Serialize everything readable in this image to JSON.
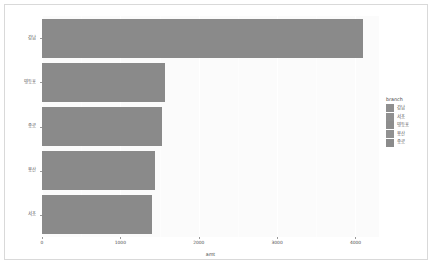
{
  "chart_data": {
    "type": "bar",
    "orientation": "horizontal",
    "title": "",
    "xlabel": "amt",
    "ylabel": "reorder(branch, -amt)",
    "categories": [
      "강남",
      "영등포",
      "종로",
      "용산",
      "서초"
    ],
    "values": [
      4100,
      1570,
      1530,
      1440,
      1405
    ],
    "xlim": [
      0,
      4300
    ],
    "xticks": [
      0,
      1000,
      2000,
      3000,
      4000
    ],
    "xtick_labels": [
      "0",
      "1000",
      "2000",
      "3000",
      "4000"
    ],
    "grid": true,
    "legend_position": "right",
    "bar_color": "#8a8a8a",
    "panel_background": "#fbfbfb",
    "series": [
      {
        "name": "amt",
        "values": [
          4100,
          1570,
          1530,
          1440,
          1405
        ]
      }
    ]
  },
  "axes": {
    "y_title": "reorder(branch, -amt)",
    "x_title": "amt"
  },
  "legend": {
    "title": "branch",
    "items": [
      {
        "label": "강남",
        "color": "#8f8f8f"
      },
      {
        "label": "서초",
        "color": "#909090"
      },
      {
        "label": "영등포",
        "color": "#8d8d8d"
      },
      {
        "label": "용산",
        "color": "#919191"
      },
      {
        "label": "종로",
        "color": "#8b8b8b"
      }
    ]
  }
}
